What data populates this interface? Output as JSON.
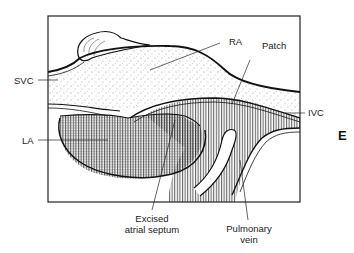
{
  "diagram": {
    "type": "anatomical illustration",
    "panel_letter": "E",
    "labels": {
      "ra": "RA",
      "patch": "Patch",
      "svc": "SVC",
      "ivc": "IVC",
      "la": "LA",
      "excised_line1": "Excised",
      "excised_line2": "atrial septum",
      "pulmonary_line1": "Pulmonary",
      "pulmonary_line2": "vein"
    },
    "colors": {
      "ink": "#111111",
      "background": "#ffffff"
    }
  }
}
